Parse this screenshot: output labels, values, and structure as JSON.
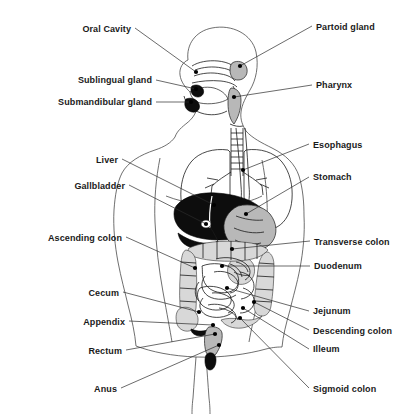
{
  "figure": {
    "background_color": "#ffffff",
    "line_color": "#1a1a1a",
    "text_color": "#1a1a1a",
    "organ_dark_color": "#0d0d0d",
    "organ_gray_color": "#b8b8b8",
    "outline_color": "#4a4a4a"
  },
  "labels_left": [
    {
      "id": "oral-cavity",
      "text": "Oral Cavity",
      "text_x": 131,
      "text_y": 32,
      "line": [
        [
          135,
          28
        ],
        [
          196,
          72
        ]
      ],
      "dot": [
        196,
        72
      ]
    },
    {
      "id": "sublingual-gland",
      "text": "Sublingual gland",
      "text_x": 152,
      "text_y": 83,
      "line": [
        [
          156,
          80
        ],
        [
          196,
          89
        ]
      ],
      "dot": [
        196,
        89
      ]
    },
    {
      "id": "submandibular-gland",
      "text": "Submandibular gland",
      "text_x": 152,
      "text_y": 105,
      "line": [
        [
          156,
          102
        ],
        [
          191,
          102
        ]
      ],
      "dot": [
        191,
        102
      ]
    },
    {
      "id": "liver",
      "text": "Liver",
      "text_x": 118,
      "text_y": 163,
      "line": [
        [
          122,
          159
        ],
        [
          214,
          205
        ]
      ],
      "dot": [
        214,
        205
      ]
    },
    {
      "id": "gallbladder",
      "text": "Gallbladder",
      "text_x": 125,
      "text_y": 189,
      "line": [
        [
          129,
          185
        ],
        [
          206,
          224
        ]
      ],
      "dot": [
        206,
        224
      ]
    },
    {
      "id": "ascending-colon",
      "text": "Ascending colon",
      "text_x": 122,
      "text_y": 241,
      "line": [
        [
          126,
          237
        ],
        [
          195,
          268
        ]
      ],
      "dot": [
        195,
        268
      ]
    },
    {
      "id": "cecum",
      "text": "Cecum",
      "text_x": 119,
      "text_y": 296,
      "line": [
        [
          123,
          292
        ],
        [
          199,
          312
        ]
      ],
      "dot": [
        199,
        312
      ]
    },
    {
      "id": "appendix",
      "text": "Appendix",
      "text_x": 125,
      "text_y": 325,
      "line": [
        [
          129,
          321
        ],
        [
          213,
          325
        ]
      ],
      "dot": [
        213,
        325
      ]
    },
    {
      "id": "rectum",
      "text": "Rectum",
      "text_x": 122,
      "text_y": 354,
      "line": [
        [
          126,
          350
        ],
        [
          215,
          334
        ]
      ],
      "dot": [
        215,
        334
      ]
    },
    {
      "id": "anus",
      "text": "Anus",
      "text_x": 117,
      "text_y": 392,
      "line": [
        [
          121,
          388
        ],
        [
          219,
          345
        ]
      ],
      "dot": [
        219,
        345
      ]
    }
  ],
  "labels_right": [
    {
      "id": "parotid-gland",
      "text": "Partoid gland",
      "text_x": 316,
      "text_y": 30,
      "line": [
        [
          312,
          26
        ],
        [
          240,
          66
        ]
      ],
      "dot": [
        240,
        66
      ]
    },
    {
      "id": "pharynx",
      "text": "Pharynx",
      "text_x": 316,
      "text_y": 88,
      "line": [
        [
          312,
          85
        ],
        [
          234,
          97
        ]
      ],
      "dot": [
        234,
        97
      ]
    },
    {
      "id": "esophagus",
      "text": "Esophagus",
      "text_x": 313,
      "text_y": 148,
      "line": [
        [
          309,
          144
        ],
        [
          243,
          170
        ]
      ],
      "dot": [
        243,
        170
      ]
    },
    {
      "id": "stomach",
      "text": "Stomach",
      "text_x": 313,
      "text_y": 180,
      "line": [
        [
          309,
          177
        ],
        [
          246,
          214
        ]
      ],
      "dot": [
        246,
        214
      ]
    },
    {
      "id": "transverse-colon",
      "text": "Transverse colon",
      "text_x": 314,
      "text_y": 245,
      "line": [
        [
          310,
          241
        ],
        [
          232,
          249
        ]
      ],
      "dot": [
        232,
        249
      ]
    },
    {
      "id": "duodenum",
      "text": "Duodenum",
      "text_x": 314,
      "text_y": 269,
      "line": [
        [
          310,
          266
        ],
        [
          222,
          266
        ]
      ],
      "dot": [
        222,
        266
      ]
    },
    {
      "id": "jejunum",
      "text": "Jejunum",
      "text_x": 313,
      "text_y": 314,
      "line": [
        [
          309,
          311
        ],
        [
          227,
          288
        ]
      ],
      "dot": [
        227,
        288
      ]
    },
    {
      "id": "descending-colon",
      "text": "Descending colon",
      "text_x": 313,
      "text_y": 334,
      "line": [
        [
          309,
          330
        ],
        [
          254,
          302
        ]
      ],
      "dot": [
        254,
        302
      ]
    },
    {
      "id": "ileum",
      "text": "Illeum",
      "text_x": 313,
      "text_y": 352,
      "line": [
        [
          309,
          349
        ],
        [
          243,
          308
        ]
      ],
      "dot": [
        243,
        308
      ]
    },
    {
      "id": "sigmoid-colon",
      "text": "Sigmoid colon",
      "text_x": 313,
      "text_y": 392,
      "line": [
        [
          309,
          388
        ],
        [
          240,
          318
        ]
      ],
      "dot": [
        240,
        318
      ]
    }
  ]
}
